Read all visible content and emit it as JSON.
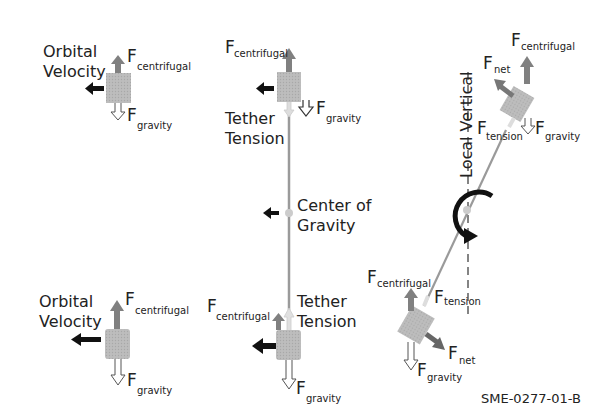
{
  "labels": {
    "orbital_velocity_l1": "Orbital",
    "orbital_velocity_l2": "Velocity",
    "F": "F",
    "centrifugal": "centrifugal",
    "gravity": "gravity",
    "tension": "tension",
    "net": "net",
    "tether_l1": "Tether",
    "tether_l2": "Tension",
    "cog_l1": "Center of",
    "cog_l2": "Gravity",
    "local_vertical": "Local Vertical",
    "figure_code": "SME-0277-01-B"
  },
  "colors": {
    "mass": "#b8b8b8",
    "arrow_gray": "#808080",
    "arrow_black": "#111111",
    "tether": "#9a9a9a",
    "text": "#222222"
  }
}
